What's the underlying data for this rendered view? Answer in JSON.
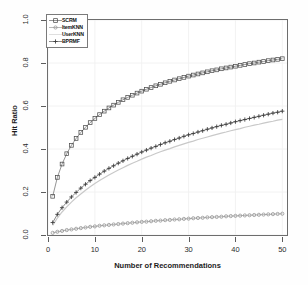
{
  "chart_data": {
    "type": "line",
    "title": "",
    "xlabel": "Number of Recommendations",
    "ylabel": "Hit Ratio",
    "xlim": [
      0,
      51
    ],
    "ylim": [
      0.0,
      1.0
    ],
    "xticks": [
      "0",
      "10",
      "20",
      "30",
      "40",
      "50"
    ],
    "xtick_values": [
      0,
      10,
      20,
      30,
      40,
      50
    ],
    "yticks": [
      "0.0",
      "0.2",
      "0.4",
      "0.6",
      "0.8",
      "1.0"
    ],
    "ytick_values": [
      0.0,
      0.2,
      0.4,
      0.6,
      0.8,
      1.0
    ],
    "grid": true,
    "legend_position": "top-left",
    "x": [
      1,
      2,
      3,
      4,
      5,
      6,
      7,
      8,
      9,
      10,
      11,
      12,
      13,
      14,
      15,
      16,
      17,
      18,
      19,
      20,
      21,
      22,
      23,
      24,
      25,
      26,
      27,
      28,
      29,
      30,
      31,
      32,
      33,
      34,
      35,
      36,
      37,
      38,
      39,
      40,
      41,
      42,
      43,
      44,
      45,
      46,
      47,
      48,
      49,
      50
    ],
    "series": [
      {
        "name": "SCRM",
        "marker": "square",
        "color": "#4d4d4d",
        "values": [
          0.18,
          0.268,
          0.33,
          0.378,
          0.417,
          0.449,
          0.477,
          0.501,
          0.523,
          0.542,
          0.56,
          0.576,
          0.591,
          0.604,
          0.617,
          0.629,
          0.64,
          0.65,
          0.66,
          0.669,
          0.678,
          0.686,
          0.694,
          0.701,
          0.708,
          0.715,
          0.721,
          0.727,
          0.733,
          0.739,
          0.744,
          0.749,
          0.754,
          0.759,
          0.764,
          0.768,
          0.773,
          0.777,
          0.781,
          0.785,
          0.789,
          0.793,
          0.797,
          0.8,
          0.804,
          0.807,
          0.811,
          0.814,
          0.817,
          0.82
        ]
      },
      {
        "name": "ItemKNN",
        "marker": "circle",
        "color": "#8a8a8a",
        "values": [
          0.01,
          0.015,
          0.019,
          0.023,
          0.026,
          0.029,
          0.032,
          0.035,
          0.038,
          0.04,
          0.043,
          0.045,
          0.047,
          0.049,
          0.051,
          0.053,
          0.055,
          0.057,
          0.059,
          0.061,
          0.062,
          0.064,
          0.066,
          0.067,
          0.069,
          0.07,
          0.072,
          0.073,
          0.075,
          0.076,
          0.078,
          0.079,
          0.08,
          0.082,
          0.083,
          0.084,
          0.085,
          0.087,
          0.088,
          0.089,
          0.09,
          0.091,
          0.092,
          0.093,
          0.094,
          0.095,
          0.096,
          0.097,
          0.098,
          0.099
        ]
      },
      {
        "name": "UserKNN",
        "marker": "none",
        "color": "#c9c9c9",
        "values": [
          0.045,
          0.079,
          0.107,
          0.131,
          0.153,
          0.173,
          0.191,
          0.208,
          0.224,
          0.239,
          0.253,
          0.266,
          0.279,
          0.291,
          0.302,
          0.313,
          0.324,
          0.334,
          0.343,
          0.353,
          0.362,
          0.37,
          0.379,
          0.387,
          0.395,
          0.402,
          0.41,
          0.417,
          0.424,
          0.431,
          0.437,
          0.444,
          0.45,
          0.456,
          0.462,
          0.468,
          0.474,
          0.479,
          0.485,
          0.49,
          0.495,
          0.501,
          0.506,
          0.511,
          0.515,
          0.52,
          0.525,
          0.529,
          0.534,
          0.538
        ]
      },
      {
        "name": "BPRMF",
        "marker": "plus",
        "color": "#3a3a3a",
        "values": [
          0.058,
          0.096,
          0.127,
          0.153,
          0.177,
          0.198,
          0.218,
          0.236,
          0.253,
          0.268,
          0.283,
          0.297,
          0.31,
          0.322,
          0.334,
          0.345,
          0.356,
          0.366,
          0.376,
          0.386,
          0.395,
          0.404,
          0.412,
          0.421,
          0.429,
          0.436,
          0.444,
          0.451,
          0.459,
          0.466,
          0.472,
          0.479,
          0.485,
          0.492,
          0.498,
          0.504,
          0.51,
          0.515,
          0.521,
          0.527,
          0.532,
          0.537,
          0.542,
          0.547,
          0.552,
          0.557,
          0.562,
          0.567,
          0.571,
          0.576
        ]
      }
    ]
  },
  "legend": {
    "entries": [
      {
        "label": "SCRM"
      },
      {
        "label": "ItemKNN"
      },
      {
        "label": "UserKNN"
      },
      {
        "label": "BPRMF"
      }
    ]
  },
  "axes": {
    "y_title": "Hit Ratio",
    "x_title": "Number of Recommendations"
  }
}
